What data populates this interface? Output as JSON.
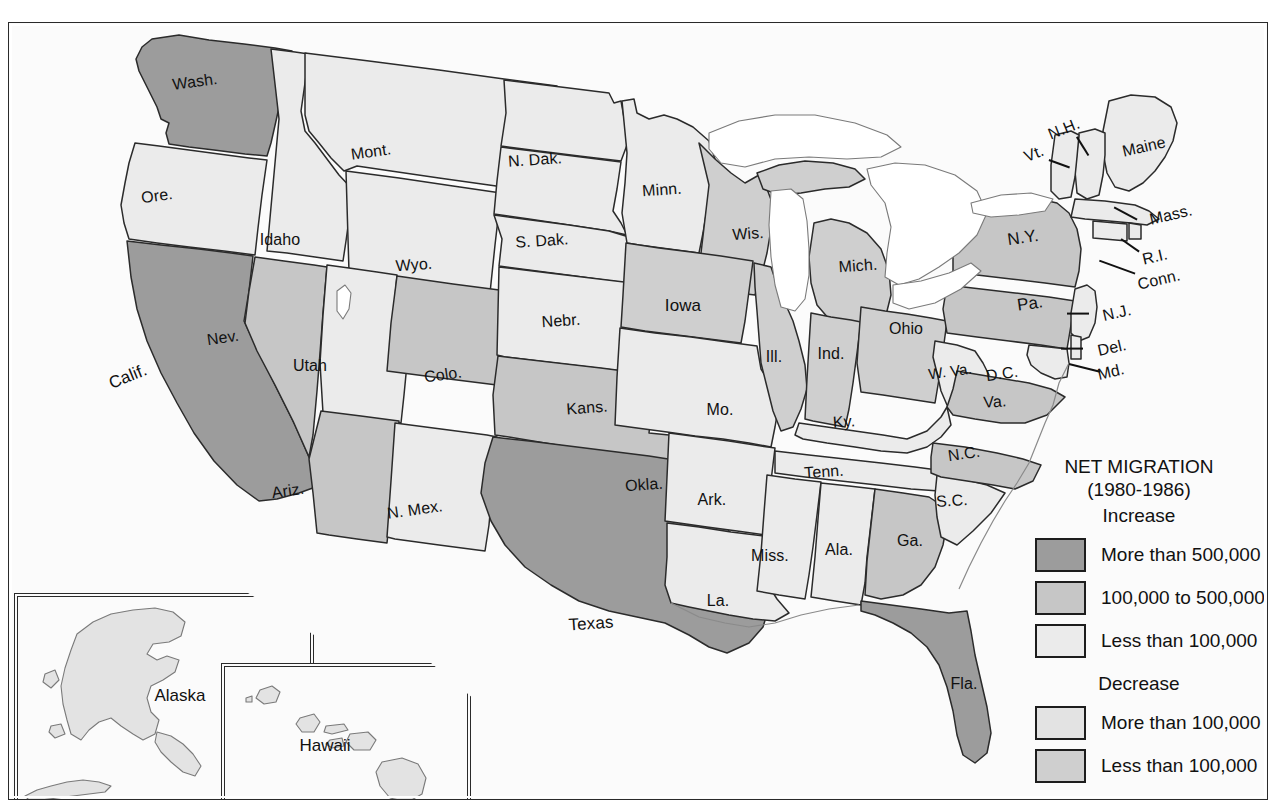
{
  "map": {
    "title_lines": [
      "NET MIGRATION",
      "(1980-1986)"
    ],
    "heading_increase": "Increase",
    "heading_decrease": "Decrease",
    "legend": [
      {
        "label": "More than 500,000",
        "color": "#9c9c9c",
        "group": "increase"
      },
      {
        "label": "100,000 to 500,000",
        "color": "#c6c6c6",
        "group": "increase"
      },
      {
        "label": "Less than 100,000",
        "color": "#ebebeb",
        "group": "increase"
      },
      {
        "label": "More than 100,000",
        "color": "#e3e3e3",
        "group": "decrease"
      },
      {
        "label": "Less than 100,000",
        "color": "#cfcfcf",
        "group": "decrease"
      }
    ],
    "insets": [
      {
        "name": "alaska",
        "label": "Alaska"
      },
      {
        "name": "hawaii",
        "label": "Hawaii"
      }
    ],
    "states": [
      {
        "abbr": "WA",
        "label": "Wash.",
        "x": 186,
        "y": 59,
        "size": "s-med",
        "rot": "rot-n7",
        "cat": "increase_gt500k"
      },
      {
        "abbr": "OR",
        "label": "Ore.",
        "x": 148,
        "y": 173,
        "size": "s-med",
        "rot": "rot-n7",
        "cat": "increase_lt100k"
      },
      {
        "abbr": "CA",
        "label": "Calif.",
        "x": 119,
        "y": 354,
        "size": "s-big",
        "rot": "rot-n20",
        "cat": "increase_gt500k"
      },
      {
        "abbr": "NV",
        "label": "Nev.",
        "x": 214,
        "y": 315,
        "size": "s-med",
        "rot": "rot-n7",
        "cat": "increase_100to500k"
      },
      {
        "abbr": "ID",
        "label": "Idaho",
        "x": 271,
        "y": 217,
        "size": "s-med",
        "rot": "",
        "cat": "increase_lt100k"
      },
      {
        "abbr": "UT",
        "label": "Utah",
        "x": 301,
        "y": 343,
        "size": "s-med",
        "rot": "",
        "cat": "increase_lt100k"
      },
      {
        "abbr": "AZ",
        "label": "Ariz.",
        "x": 279,
        "y": 468,
        "size": "s-med",
        "rot": "rot-n7",
        "cat": "increase_100to500k"
      },
      {
        "abbr": "MT",
        "label": "Mont.",
        "x": 362,
        "y": 129,
        "size": "s-med",
        "rot": "rot-n7",
        "cat": "increase_lt100k"
      },
      {
        "abbr": "WY",
        "label": "Wyo.",
        "x": 405,
        "y": 242,
        "size": "s-med",
        "rot": "rot-n3",
        "cat": "increase_lt100k"
      },
      {
        "abbr": "CO",
        "label": "Colo.",
        "x": 434,
        "y": 352,
        "size": "s-med",
        "rot": "rot-n7",
        "cat": "increase_100to500k"
      },
      {
        "abbr": "NM",
        "label": "N. Mex.",
        "x": 406,
        "y": 487,
        "size": "s-med",
        "rot": "rot-n7",
        "cat": "increase_lt100k"
      },
      {
        "abbr": "ND",
        "label": "N. Dak.",
        "x": 526,
        "y": 137,
        "size": "s-med",
        "rot": "rot-n3",
        "cat": "increase_lt100k"
      },
      {
        "abbr": "SD",
        "label": "S. Dak.",
        "x": 533,
        "y": 218,
        "size": "s-med",
        "rot": "rot-n3",
        "cat": "increase_lt100k"
      },
      {
        "abbr": "NE",
        "label": "Nebr.",
        "x": 552,
        "y": 298,
        "size": "s-med",
        "rot": "rot-n3",
        "cat": "increase_lt100k"
      },
      {
        "abbr": "KS",
        "label": "Kans.",
        "x": 578,
        "y": 385,
        "size": "s-med",
        "rot": "rot-n3",
        "cat": "increase_lt100k"
      },
      {
        "abbr": "OK",
        "label": "Okla.",
        "x": 635,
        "y": 462,
        "size": "s-med",
        "rot": "rot-n3",
        "cat": "increase_100to500k"
      },
      {
        "abbr": "TX",
        "label": "Texas",
        "x": 582,
        "y": 601,
        "size": "s-big",
        "rot": "rot-n3",
        "cat": "increase_gt500k"
      },
      {
        "abbr": "MN",
        "label": "Minn.",
        "x": 653,
        "y": 167,
        "size": "s-med",
        "rot": "rot-n3",
        "cat": "increase_lt100k"
      },
      {
        "abbr": "IA",
        "label": "Iowa",
        "x": 674,
        "y": 283,
        "size": "s-big",
        "rot": "",
        "cat": "decrease_lt100k"
      },
      {
        "abbr": "MO",
        "label": "Mo.",
        "x": 711,
        "y": 387,
        "size": "s-med",
        "rot": "",
        "cat": "increase_lt100k"
      },
      {
        "abbr": "AR",
        "label": "Ark.",
        "x": 703,
        "y": 477,
        "size": "s-med",
        "rot": "",
        "cat": "increase_lt100k"
      },
      {
        "abbr": "LA",
        "label": "La.",
        "x": 709,
        "y": 578,
        "size": "s-med",
        "rot": "",
        "cat": "increase_lt100k"
      },
      {
        "abbr": "WI",
        "label": "Wis.",
        "x": 739,
        "y": 211,
        "size": "s-med",
        "rot": "rot-n3",
        "cat": "decrease_lt100k"
      },
      {
        "abbr": "IL",
        "label": "Ill.",
        "x": 765,
        "y": 334,
        "size": "s-med",
        "rot": "",
        "cat": "decrease_lt100k"
      },
      {
        "abbr": "MS",
        "label": "Miss.",
        "x": 761,
        "y": 533,
        "size": "s-med",
        "rot": "",
        "cat": "increase_lt100k"
      },
      {
        "abbr": "MI",
        "label": "Mich.",
        "x": 849,
        "y": 243,
        "size": "s-med",
        "rot": "rot-n3",
        "cat": "decrease_lt100k"
      },
      {
        "abbr": "IN",
        "label": "Ind.",
        "x": 822,
        "y": 331,
        "size": "s-med",
        "rot": "",
        "cat": "decrease_lt100k"
      },
      {
        "abbr": "KY",
        "label": "Ky.",
        "x": 835,
        "y": 399,
        "size": "s-med",
        "rot": "rot-n3",
        "cat": "increase_lt100k"
      },
      {
        "abbr": "TN",
        "label": "Tenn.",
        "x": 815,
        "y": 449,
        "size": "s-med",
        "rot": "rot-n3",
        "cat": "increase_lt100k"
      },
      {
        "abbr": "AL",
        "label": "Ala.",
        "x": 830,
        "y": 527,
        "size": "s-med",
        "rot": "",
        "cat": "increase_lt100k"
      },
      {
        "abbr": "OH",
        "label": "Ohio",
        "x": 897,
        "y": 306,
        "size": "s-med",
        "rot": "",
        "cat": "decrease_lt100k"
      },
      {
        "abbr": "GA",
        "label": "Ga.",
        "x": 901,
        "y": 518,
        "size": "s-med",
        "rot": "",
        "cat": "increase_100to500k"
      },
      {
        "abbr": "FL",
        "label": "Fla.",
        "x": 955,
        "y": 661,
        "size": "s-med",
        "rot": "",
        "cat": "increase_gt500k"
      },
      {
        "abbr": "SC",
        "label": "S.C.",
        "x": 943,
        "y": 478,
        "size": "s-med",
        "rot": "rot-n3",
        "cat": "increase_lt100k"
      },
      {
        "abbr": "NC",
        "label": "N.C.",
        "x": 955,
        "y": 431,
        "size": "s-med",
        "rot": "rot-n7",
        "cat": "increase_100to500k"
      },
      {
        "abbr": "WV",
        "label": "W. Va.",
        "x": 941,
        "y": 348,
        "size": "s-sm",
        "rot": "rot-n7",
        "cat": "increase_lt100k"
      },
      {
        "abbr": "VA",
        "label": "Va.",
        "x": 986,
        "y": 379,
        "size": "s-med",
        "rot": "rot-n3",
        "cat": "increase_100to500k"
      },
      {
        "abbr": "DC",
        "label": "D.C.",
        "x": 993,
        "y": 351,
        "size": "s-med",
        "rot": "rot-n7",
        "cat": "increase_lt100k"
      },
      {
        "abbr": "PA",
        "label": "Pa.",
        "x": 1021,
        "y": 281,
        "size": "s-big",
        "rot": "rot-n7",
        "cat": "increase_100to500k"
      },
      {
        "abbr": "NY",
        "label": "N.Y.",
        "x": 1014,
        "y": 215,
        "size": "s-big",
        "rot": "rot-n7",
        "cat": "increase_100to500k"
      },
      {
        "abbr": "ME",
        "label": "Maine",
        "x": 1135,
        "y": 124,
        "size": "s-med",
        "rot": "rot-n12",
        "cat": "increase_lt100k"
      },
      {
        "abbr": "VT",
        "label": "Vt.",
        "x": 1025,
        "y": 131,
        "size": "s-med",
        "rot": "rot-n20",
        "cat": "increase_lt100k"
      },
      {
        "abbr": "NH",
        "label": "N.H.",
        "x": 1055,
        "y": 106,
        "size": "s-med",
        "rot": "rot-n20",
        "cat": "increase_lt100k"
      },
      {
        "abbr": "MA",
        "label": "Mass.",
        "x": 1162,
        "y": 192,
        "size": "s-med",
        "rot": "rot-n12",
        "cat": "increase_lt100k"
      },
      {
        "abbr": "RI",
        "label": "R.I.",
        "x": 1146,
        "y": 234,
        "size": "s-med",
        "rot": "rot-n12",
        "cat": "increase_lt100k"
      },
      {
        "abbr": "CT",
        "label": "Conn.",
        "x": 1150,
        "y": 257,
        "size": "s-med",
        "rot": "rot-n12",
        "cat": "increase_lt100k"
      },
      {
        "abbr": "NJ",
        "label": "N.J.",
        "x": 1108,
        "y": 290,
        "size": "s-med",
        "rot": "rot-n12",
        "cat": "increase_lt100k"
      },
      {
        "abbr": "DE",
        "label": "Del.",
        "x": 1103,
        "y": 325,
        "size": "s-med",
        "rot": "rot-n12",
        "cat": "increase_lt100k"
      },
      {
        "abbr": "MD",
        "label": "Md.",
        "x": 1102,
        "y": 349,
        "size": "s-med",
        "rot": "rot-n12",
        "cat": "increase_lt100k"
      }
    ]
  }
}
